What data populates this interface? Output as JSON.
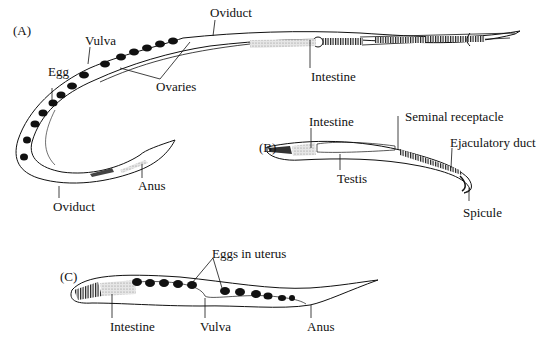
{
  "figure": {
    "panels": [
      {
        "id": "A",
        "label": "(A)",
        "annotations": [
          "Oviduct",
          "Vulva",
          "Egg",
          "Ovaries",
          "Intestine",
          "Anus",
          "Oviduct"
        ]
      },
      {
        "id": "B",
        "label": "(B)",
        "annotations": [
          "Intestine",
          "Seminal receptacle",
          "Ejaculatory duct",
          "Testis",
          "Spicule"
        ]
      },
      {
        "id": "C",
        "label": "(C)",
        "annotations": [
          "Eggs in uterus",
          "Intestine",
          "Vulva",
          "Anus"
        ]
      }
    ]
  },
  "labels": {
    "a_panel": "(A)",
    "a_oviduct_top": "Oviduct",
    "a_vulva": "Vulva",
    "a_egg": "Egg",
    "a_ovaries": "Ovaries",
    "a_intestine": "Intestine",
    "a_anus": "Anus",
    "a_oviduct_bottom": "Oviduct",
    "b_panel": "(B)",
    "b_intestine": "Intestine",
    "b_seminal": "Seminal receptacle",
    "b_ejaculatory": "Ejaculatory duct",
    "b_testis": "Testis",
    "b_spicule": "Spicule",
    "c_panel": "(C)",
    "c_eggs": "Eggs in uterus",
    "c_intestine": "Intestine",
    "c_vulva": "Vulva",
    "c_anus": "Anus"
  },
  "colors": {
    "ink": "#111111",
    "stipple": "#bdbdbd",
    "egg": "#111111",
    "background": "#ffffff"
  }
}
